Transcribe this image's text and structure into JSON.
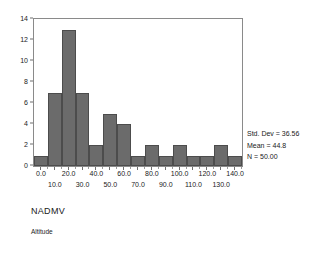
{
  "chart_data": {
    "type": "bar",
    "title": "",
    "subtitle": "",
    "xlabel": "",
    "ylabel": "",
    "categories": [
      "0.0",
      "10.0",
      "20.0",
      "30.0",
      "40.0",
      "50.0",
      "60.0",
      "70.0",
      "80.0",
      "90.0",
      "100.0",
      "110.0",
      "120.0",
      "130.0",
      "140.0"
    ],
    "x": [
      0,
      10,
      20,
      30,
      40,
      50,
      60,
      70,
      80,
      90,
      100,
      110,
      120,
      130,
      140
    ],
    "values": [
      1,
      7,
      13,
      7,
      2,
      5,
      4,
      1,
      2,
      1,
      2,
      1,
      1,
      2,
      1
    ],
    "bin_width": 10,
    "bin_edges": [
      -5,
      5,
      15,
      25,
      35,
      45,
      55,
      65,
      75,
      85,
      95,
      105,
      115,
      125,
      135,
      145
    ],
    "xlim": [
      -5,
      145
    ],
    "ylim": [
      0,
      14
    ],
    "y_ticks": [
      "0",
      "2",
      "4",
      "6",
      "8",
      "10",
      "12",
      "14"
    ],
    "y_tick_values": [
      0,
      2,
      4,
      6,
      8,
      10,
      12,
      14
    ],
    "x_ticks_row_a": [
      "0.0",
      "20.0",
      "40.0",
      "60.0",
      "80.0",
      "100.0",
      "120.0",
      "140.0"
    ],
    "x_tick_values_row_a": [
      0,
      20,
      40,
      60,
      80,
      100,
      120,
      140
    ],
    "x_ticks_row_b": [
      "10.0",
      "30.0",
      "50.0",
      "70.0",
      "90.0",
      "110.0",
      "130.0"
    ],
    "x_tick_values_row_b": [
      10,
      30,
      50,
      70,
      90,
      110,
      130
    ],
    "grid": false,
    "legend": "none",
    "bar_color": "#6b6b6b",
    "bar_edge_color": "#4c4c4c",
    "frame_color": "#8a8a8a"
  },
  "stats": {
    "std_dev": "Std. Dev = 36.56",
    "mean": "Mean = 44.8",
    "n": "N = 50.00"
  },
  "captions": {
    "primary": "NADMV",
    "secondary": "Altitude"
  }
}
